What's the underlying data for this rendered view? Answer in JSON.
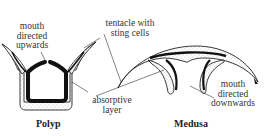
{
  "figure": {
    "organisms": [
      {
        "name": "Polyp",
        "caption": "Polyp"
      },
      {
        "name": "Medusa",
        "caption": "Medusa"
      }
    ],
    "labels": {
      "polyp_mouth": [
        "mouth",
        "directed",
        "upwards"
      ],
      "tentacle": [
        "tentacle with",
        "sting cells"
      ],
      "absorptive": [
        "absorptive",
        "layer"
      ],
      "medusa_mouth": [
        "mouth",
        "directed",
        "downwards"
      ]
    },
    "colors": {
      "outline": "#222222",
      "absorptive_layer": "#111111",
      "stipple": "#888888",
      "background": "#ffffff"
    }
  }
}
